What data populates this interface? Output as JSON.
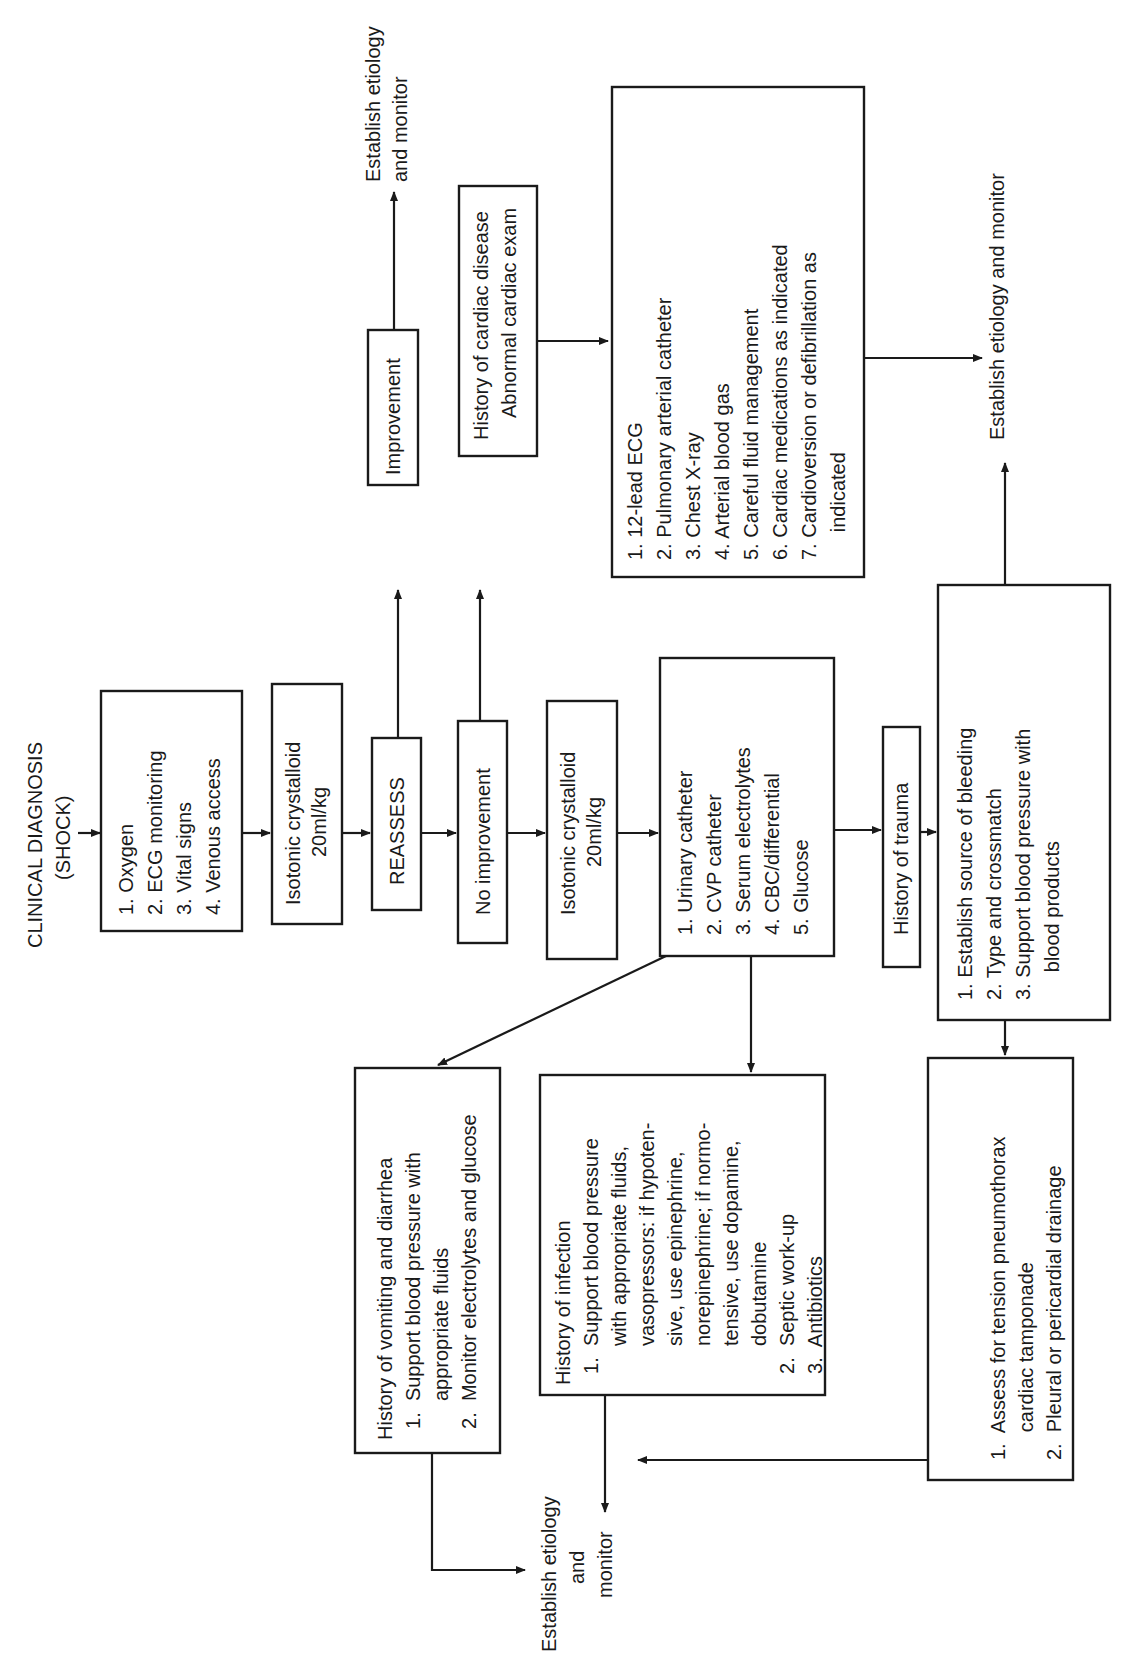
{
  "title": {
    "line1": "CLINICAL DIAGNOSIS",
    "line2": "(SHOCK)"
  },
  "initial_steps": {
    "items": [
      "1.  Oxygen",
      "2.  ECG monitoring",
      "3.  Vital signs",
      "4.  Venous access"
    ]
  },
  "crystalloid_1": {
    "line1": "Isotonic crystalloid",
    "line2": "20ml/kg"
  },
  "reassess": {
    "label": "REASSESS"
  },
  "improvement": {
    "label": "Improvement"
  },
  "improvement_outcome": {
    "line1": "Establish etiology",
    "line2": "and monitor"
  },
  "no_improvement": {
    "label": "No improvement"
  },
  "cardiac_history": {
    "line1": "History of cardiac disease",
    "line2": "Abnormal cardiac exam"
  },
  "cardiac_workup": {
    "items": [
      "1.  12-lead ECG",
      "2.  Pulmonary arterial catheter",
      "3.  Chest X-ray",
      "4.  Arterial blood gas",
      "5.  Careful fluid management",
      "6.  Cardiac medications as indicated",
      "7.  Cardioversion or defibrillation as",
      "     indicated"
    ]
  },
  "cardiac_outcome": {
    "label": "Establish etiology and monitor"
  },
  "crystalloid_2": {
    "line1": "Isotonic crystalloid",
    "line2": "20ml/kg"
  },
  "diagnostics": {
    "items": [
      "1.  Urinary catheter",
      "2.  CVP catheter",
      "3.  Serum electrolytes",
      "4.  CBC/differential",
      "5.  Glucose"
    ]
  },
  "trauma_history": {
    "label": "History of trauma"
  },
  "trauma_steps": {
    "items": [
      "1.  Establish source of bleeding",
      "2.  Type and crossmatch",
      "3.  Support blood pressure with",
      "     blood products"
    ]
  },
  "trauma_outcome": {
    "label": "Establish etiology and monitor"
  },
  "vomiting_box": {
    "items": [
      "History of vomiting and diarrhea",
      "  1.  Support blood pressure with",
      "       appropriate fluids",
      "  2.  Monitor electrolytes and glucose"
    ]
  },
  "infection_box": {
    "items": [
      "History of infection",
      "  1.  Support blood pressure",
      "       with appropriate fluids,",
      "       vasopressors: if hypoten-",
      "       sive, use epinephrine,",
      "       norepinephrine; if normo-",
      "       tensive, use dopamine,",
      "       dobutamine",
      "  2.  Septic work-up",
      "  3.  Antibiotics"
    ]
  },
  "tension_box": {
    "items": [
      "1.  Assess for tension pneumothorax",
      "     cardiac tamponade",
      "2.  Pleural or pericardial drainage"
    ]
  },
  "final_outcome": {
    "line1": "Establish etiology",
    "line2": "and",
    "line3": "monitor"
  }
}
